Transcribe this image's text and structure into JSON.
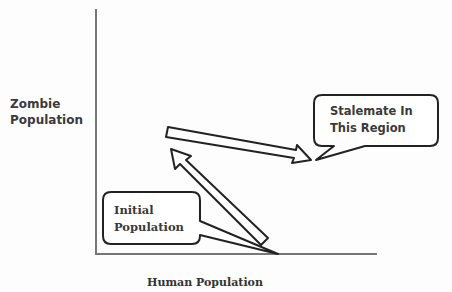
{
  "diagram": {
    "type": "phase-plot-sketch",
    "y_axis_label": "Zombie\nPopulation",
    "x_axis_label": "Human Population",
    "callouts": [
      {
        "id": "stalemate",
        "lines": [
          "Stalemate In",
          "This Region"
        ]
      },
      {
        "id": "initial",
        "lines": [
          "Initial",
          "Population"
        ]
      }
    ],
    "arrows": [
      {
        "from": "initial population (x-axis)",
        "to": "upper-left region",
        "direction": "up-left"
      },
      {
        "from": "upper-left region",
        "to": "stalemate region",
        "direction": "right-down"
      }
    ],
    "colors": {
      "axis": "#777777",
      "outline": "#222222",
      "text": "#3a3a3a"
    }
  }
}
